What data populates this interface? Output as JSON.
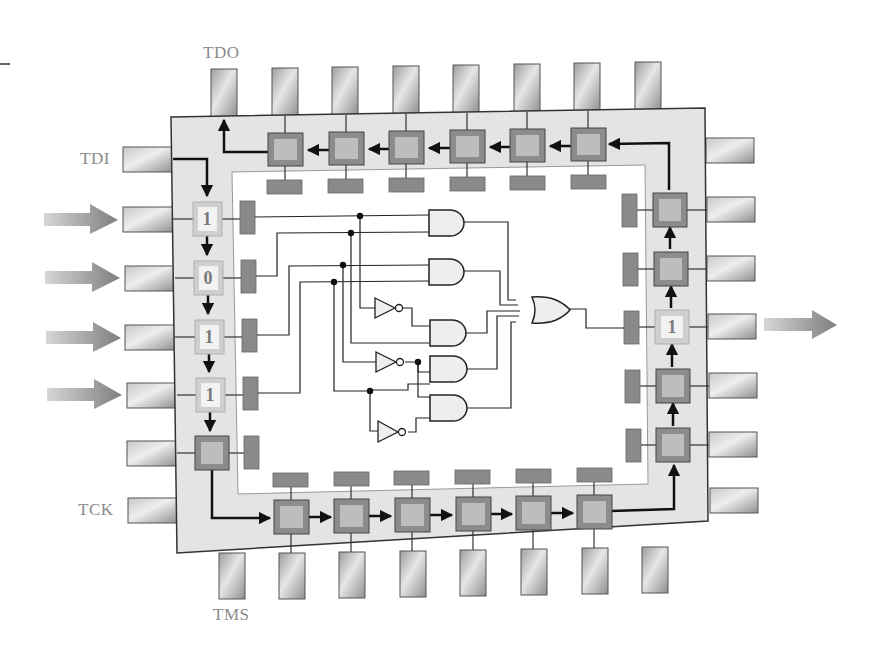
{
  "colors": {
    "chip_body": "#e4e4e4",
    "chip_border": "#333333",
    "core_area": "#ffffff",
    "cell_outer": "#8c8c8c",
    "cell_inner": "#bdbdbd",
    "cell_highlight_outer": "#cfcfcf",
    "cell_highlight_inner": "#f2f2f2",
    "pad": "#8a8a8a",
    "pin_light": "#e0e0e0",
    "pin_dark": "#9a9a9a",
    "arrow": "#8e8e8e",
    "wire": "#222222",
    "gate_fill": "#eeeeee",
    "label": "#8a8a8a"
  },
  "pin_labels": {
    "tdo": "TDO",
    "tdi": "TDI",
    "tck": "TCK",
    "tms": "TMS"
  },
  "input_cells": [
    {
      "value": "1"
    },
    {
      "value": "0"
    },
    {
      "value": "1"
    },
    {
      "value": "1"
    }
  ],
  "output_cell": {
    "value": "1"
  },
  "logic": {
    "and_gates": 5,
    "not_gates": 3,
    "or_gates": 1,
    "or_inputs": 5
  },
  "boundary_chain": {
    "top_cells": 6,
    "bottom_cells": 6,
    "left_cells": 5,
    "right_cells": 5
  }
}
